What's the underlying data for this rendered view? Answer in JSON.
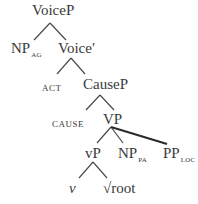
{
  "diagram": {
    "type": "syntax-tree",
    "nodes": {
      "voicep": {
        "label": "VoiceP"
      },
      "np_ag": {
        "label": "NP",
        "sub": "AG"
      },
      "voice_bar": {
        "label": "Voice′"
      },
      "act": {
        "label": "ACT"
      },
      "causep": {
        "label": "CauseP"
      },
      "cause": {
        "label": "CAUSE"
      },
      "vp": {
        "label": "VP"
      },
      "little_vp": {
        "label": "vP"
      },
      "np_pa": {
        "label": "NP",
        "sub": "PA"
      },
      "pp_loc": {
        "label": "PP",
        "sub": "LOC"
      },
      "little_v": {
        "label": "v"
      },
      "root": {
        "label": "√root"
      }
    },
    "edges": [
      {
        "from": "VoiceP",
        "to": "NP_AG"
      },
      {
        "from": "VoiceP",
        "to": "Voice′"
      },
      {
        "from": "Voice′",
        "to": "ACT"
      },
      {
        "from": "Voice′",
        "to": "CauseP"
      },
      {
        "from": "CauseP",
        "to": "CAUSE"
      },
      {
        "from": "CauseP",
        "to": "VP"
      },
      {
        "from": "VP",
        "to": "vP"
      },
      {
        "from": "VP",
        "to": "NP_PA"
      },
      {
        "from": "VP",
        "to": "PP_LOC"
      },
      {
        "from": "vP",
        "to": "v"
      },
      {
        "from": "vP",
        "to": "√root"
      }
    ],
    "colors": {
      "text": "#3a3a3a",
      "line": "#4a4a4a",
      "thick_line": "#2a2a2a",
      "background": "#ffffff"
    }
  }
}
